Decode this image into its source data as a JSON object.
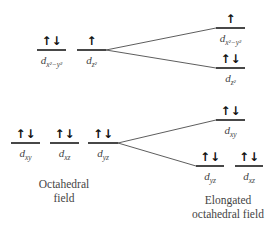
{
  "diagram": {
    "type": "crystal-field-splitting",
    "colors": {
      "levels": "#1a1a1a",
      "connectors": "#333333",
      "labels": "#444444"
    },
    "octahedral": {
      "caption_line1": "Octahedral",
      "caption_line2": "field",
      "eg": [
        {
          "orbital": "d",
          "sub": "x²−y²",
          "electrons": "↑↓"
        },
        {
          "orbital": "d",
          "sub": "z²",
          "electrons": "↑"
        }
      ],
      "t2g": [
        {
          "orbital": "d",
          "sub": "xy",
          "electrons": "↑↓"
        },
        {
          "orbital": "d",
          "sub": "xz",
          "electrons": "↑↓"
        },
        {
          "orbital": "d",
          "sub": "yz",
          "electrons": "↑↓"
        }
      ]
    },
    "elongated": {
      "caption_line1": "Elongated",
      "caption_line2": "octahedral field",
      "upper": [
        {
          "orbital": "d",
          "sub": "x²−y²",
          "electrons": "↑"
        },
        {
          "orbital": "d",
          "sub": "z²",
          "electrons": "↑↓"
        }
      ],
      "lower": [
        {
          "orbital": "d",
          "sub": "xy",
          "electrons": "↑↓"
        },
        {
          "orbital": "d",
          "sub": "yz",
          "electrons": "↑↓"
        },
        {
          "orbital": "d",
          "sub": "xz",
          "electrons": "↑↓"
        }
      ]
    }
  }
}
